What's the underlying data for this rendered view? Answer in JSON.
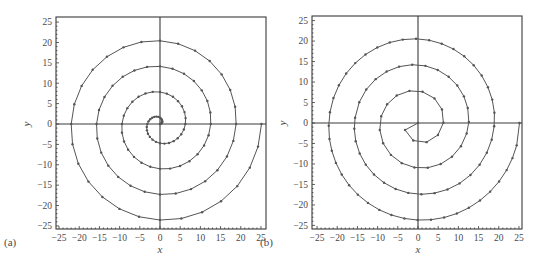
{
  "chart_data": [
    {
      "type": "line",
      "panel_label": "(a)",
      "title": "",
      "xlabel": "x",
      "ylabel": "y",
      "xlim": [
        -26,
        26
      ],
      "ylim": [
        -26,
        26
      ],
      "xticks": [
        -25,
        -20,
        -15,
        -10,
        -5,
        0,
        5,
        10,
        15,
        20,
        25
      ],
      "yticks": [
        -25,
        -20,
        -15,
        -10,
        -5,
        0,
        5,
        10,
        15,
        20,
        25
      ],
      "grid": false,
      "markers": true,
      "description": "Archimedean spiral r = theta, theta from 0 to 8*pi, sampled uniformly in theta (dense near center)",
      "x": [
        0,
        0.22,
        0.4,
        0.53,
        0.56,
        0.49,
        0.3,
        0,
        -0.4,
        -0.88,
        -1.4,
        -1.93,
        -2.43,
        -2.84,
        -3.14,
        -3.28,
        -3.23,
        -2.98,
        -2.52,
        -1.85,
        -1.0,
        0,
        1.1,
        2.24,
        3.36,
        4.39,
        5.26,
        5.91,
        6.28,
        6.34,
        6.07,
        5.44,
        4.48,
        3.21,
        1.7,
        0,
        -1.8,
        -3.6,
        -5.32,
        -6.84,
        -8.09,
        -8.97,
        -9.42,
        -9.41,
        -8.9,
        -7.89,
        -6.44,
        -4.58,
        -2.4,
        0,
        2.5,
        4.97,
        7.28,
        9.3,
        10.92,
        12.03,
        12.57,
        12.47,
        11.73,
        10.35,
        8.39,
        5.94,
        3.1,
        0,
        -3.2,
        -6.33,
        -9.23,
        -11.75,
        -13.75,
        -15.1,
        -15.71,
        -15.53,
        -14.56,
        -12.81,
        -10.35,
        -7.3,
        -3.79,
        0,
        3.89,
        7.69,
        11.19,
        14.21,
        16.58,
        18.16,
        18.85,
        18.6,
        17.39,
        15.26,
        12.31,
        8.67,
        4.49,
        0,
        -4.59,
        -9.05,
        -13.15,
        -16.67,
        -19.41,
        -21.22,
        -21.99,
        -21.66,
        -20.22,
        -17.72,
        -14.27,
        -10.03,
        -5.19,
        0,
        5.29,
        10.42,
        15.11,
        19.12,
        22.24,
        24.28,
        25.13
      ],
      "y": [
        0,
        0.05,
        0.19,
        0.42,
        0.7,
        1.01,
        1.31,
        1.57,
        1.75,
        1.82,
        1.75,
        1.54,
        1.17,
        0.65,
        0,
        -0.75,
        -1.56,
        -2.38,
        -3.16,
        -3.84,
        -4.38,
        -4.71,
        -4.81,
        -4.65,
        -4.21,
        -3.5,
        -2.53,
        -1.35,
        0,
        1.45,
        2.92,
        4.34,
        5.61,
        6.67,
        7.44,
        7.85,
        7.88,
        7.48,
        6.67,
        5.46,
        3.89,
        2.05,
        0,
        -2.15,
        -4.28,
        -6.3,
        -8.07,
        -9.5,
        -10.5,
        -11.0,
        -10.94,
        -10.31,
        -9.12,
        -7.42,
        -5.26,
        -2.75,
        0,
        2.85,
        5.65,
        8.25,
        10.53,
        12.33,
        13.56,
        14.14,
        14.0,
        13.14,
        11.58,
        9.37,
        6.62,
        3.45,
        0,
        -3.55,
        -7.01,
        -10.21,
        -12.98,
        -15.16,
        -16.63,
        -17.28,
        -17.06,
        -15.97,
        -14.04,
        -11.33,
        -7.98,
        -4.14,
        0,
        4.24,
        8.37,
        12.17,
        15.44,
        17.99,
        19.69,
        20.42,
        20.13,
        18.8,
        16.49,
        13.29,
        9.35,
        4.84,
        0,
        -4.94,
        -9.74,
        -14.13,
        -17.89,
        -20.82,
        -22.75,
        -23.56,
        -23.19,
        -21.63,
        -18.95,
        -15.25,
        -10.71,
        -5.54,
        0
      ]
    },
    {
      "type": "line",
      "panel_label": "(b)",
      "title": "",
      "xlabel": "x",
      "ylabel": "y",
      "xlim": [
        -26,
        26
      ],
      "ylim": [
        -26,
        26
      ],
      "xticks": [
        -25,
        -20,
        -15,
        -10,
        -5,
        0,
        5,
        10,
        15,
        20,
        25
      ],
      "yticks": [
        -25,
        -20,
        -15,
        -10,
        -5,
        0,
        5,
        10,
        15,
        20,
        25
      ],
      "grid": false,
      "markers": true,
      "description": "Archimedean spiral r = theta, theta from 0 to 8*pi, sampled at approximately equal arc length",
      "x": [
        0,
        -3.2,
        -1.17,
        2.12,
        4.94,
        6.29,
        5.94,
        4.08,
        1.13,
        -2.12,
        -5.26,
        -7.64,
        -9.11,
        -9.46,
        -8.63,
        -6.71,
        -4.01,
        -0.88,
        2.42,
        5.63,
        8.42,
        10.64,
        12.05,
        12.59,
        12.31,
        11.37,
        9.72,
        7.59,
        4.88,
        1.84,
        -1.42,
        -4.68,
        -7.76,
        -10.49,
        -12.81,
        -14.55,
        -15.58,
        -15.77,
        -15.42,
        -14.44,
        -12.93,
        -10.9,
        -8.42,
        -5.54,
        -2.41,
        0.84,
        4.1,
        7.3,
        10.29,
        12.99,
        15.26,
        17.04,
        18.25,
        18.86,
        18.92,
        18.38,
        17.32,
        15.77,
        13.79,
        11.44,
        8.77,
        5.87,
        2.77,
        -0.49,
        -3.77,
        -6.99,
        -10.09,
        -12.99,
        -15.54,
        -17.78,
        -19.59,
        -20.93,
        -21.8,
        -22.1,
        -21.92,
        -21.34,
        -20.33,
        -18.88,
        -17.06,
        -14.91,
        -12.39,
        -9.56,
        -6.58,
        -3.37,
        -0.09,
        3.22,
        6.47,
        9.62,
        12.6,
        15.35,
        17.87,
        20.08,
        21.95,
        23.39,
        24.44,
        25.13
      ],
      "y": [
        0,
        -1.71,
        -4.29,
        -4.68,
        -2.93,
        0.06,
        3.3,
        6.01,
        7.62,
        7.84,
        6.71,
        4.57,
        1.66,
        -1.7,
        -4.96,
        -7.79,
        -9.8,
        -10.86,
        -10.93,
        -10.02,
        -8.23,
        -5.66,
        -2.55,
        0.25,
        3.67,
        6.51,
        9.16,
        11.28,
        12.95,
        13.95,
        14.23,
        13.76,
        12.56,
        10.7,
        8.18,
        5.07,
        1.27,
        -1.41,
        -4.44,
        -7.43,
        -10.17,
        -12.59,
        -14.59,
        -16.12,
        -17.06,
        -17.41,
        -17.12,
        -16.23,
        -14.75,
        -12.7,
        -10.18,
        -7.26,
        -4.08,
        -0.79,
        2.5,
        5.71,
        8.73,
        11.58,
        14.11,
        16.28,
        18.06,
        19.36,
        20.21,
        20.55,
        20.36,
        19.66,
        18.44,
        16.74,
        14.62,
        12.1,
        9.22,
        6.1,
        2.63,
        -0.66,
        -3.92,
        -6.79,
        -9.74,
        -12.59,
        -15.18,
        -17.49,
        -19.51,
        -21.22,
        -22.47,
        -23.31,
        -23.69,
        -23.61,
        -23.08,
        -22.1,
        -20.7,
        -18.91,
        -16.76,
        -14.27,
        -11.5,
        -8.57,
        -5.46,
        0
      ]
    }
  ],
  "panels": [
    {
      "label": "(a)",
      "frame": {
        "left": 56,
        "top": 17,
        "right": 266,
        "bottom": 229
      },
      "origin": {
        "x": 160,
        "y": 124
      }
    },
    {
      "label": "(b)",
      "frame": {
        "left": 312,
        "top": 16,
        "right": 522,
        "bottom": 229
      },
      "origin": {
        "x": 418,
        "y": 123
      }
    }
  ],
  "colors": {
    "line": "#555555",
    "marker": "#555555",
    "axis": "#3a3a3a",
    "text": "#4a4a4a"
  }
}
